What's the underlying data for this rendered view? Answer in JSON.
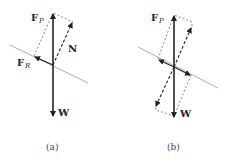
{
  "figures": [
    {
      "id": "a",
      "caption": "(a)",
      "labels": {
        "fp": {
          "main": "F",
          "sub": "P"
        },
        "n": {
          "main": "N"
        },
        "fr": {
          "main": "F",
          "sub": "R"
        },
        "w": {
          "main": "W"
        }
      }
    },
    {
      "id": "b",
      "caption": "(b)",
      "labels": {
        "fp": {
          "main": "F",
          "sub": "P"
        },
        "w": {
          "main": "W"
        }
      }
    }
  ],
  "colors": {
    "ink": "#222222",
    "incline": "#888888",
    "dash": "#555555"
  }
}
